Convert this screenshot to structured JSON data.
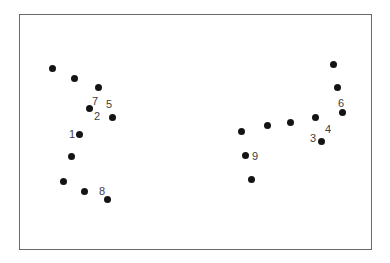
{
  "figure": {
    "frame": {
      "left": 19,
      "top": 14,
      "right": 372,
      "bottom": 250,
      "color": "#6a6a6a"
    },
    "dot_color": "#141414",
    "label_color": "#404040",
    "dots": [
      {
        "x": 52,
        "y": 68
      },
      {
        "x": 74,
        "y": 78
      },
      {
        "x": 98,
        "y": 87
      },
      {
        "x": 89,
        "y": 108
      },
      {
        "x": 112,
        "y": 117
      },
      {
        "x": 79,
        "y": 134
      },
      {
        "x": 71,
        "y": 156
      },
      {
        "x": 63,
        "y": 181
      },
      {
        "x": 84,
        "y": 191
      },
      {
        "x": 107,
        "y": 199
      },
      {
        "x": 333,
        "y": 64
      },
      {
        "x": 337,
        "y": 87
      },
      {
        "x": 342,
        "y": 112
      },
      {
        "x": 315,
        "y": 117
      },
      {
        "x": 321,
        "y": 141
      },
      {
        "x": 290,
        "y": 122
      },
      {
        "x": 267,
        "y": 125
      },
      {
        "x": 241,
        "y": 131
      },
      {
        "x": 245,
        "y": 155
      },
      {
        "x": 251,
        "y": 179
      }
    ],
    "labels": [
      {
        "text": "7",
        "x": 95,
        "y": 101
      },
      {
        "text": "2",
        "x": 97,
        "y": 116
      },
      {
        "text": "5",
        "x": 109,
        "y": 104
      },
      {
        "text": "1",
        "x": 72,
        "y": 134
      },
      {
        "text": "8",
        "x": 102,
        "y": 191
      },
      {
        "text": "6",
        "x": 341,
        "y": 103
      },
      {
        "text": "4",
        "x": 328,
        "y": 129
      },
      {
        "text": "3",
        "x": 313,
        "y": 138
      },
      {
        "text": "9",
        "x": 255,
        "y": 156
      }
    ]
  }
}
